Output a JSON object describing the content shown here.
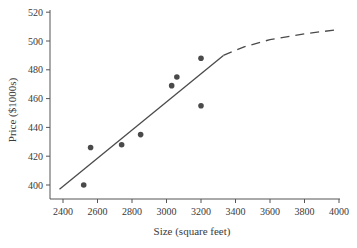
{
  "chart_data": {
    "type": "scatter",
    "title": "",
    "xlabel": "Size (square feet)",
    "ylabel": "Price ($1000s)",
    "xlim": [
      2330,
      4000
    ],
    "ylim": [
      390,
      520
    ],
    "xticks": [
      2400,
      2600,
      2800,
      3000,
      3200,
      3400,
      3600,
      3800,
      4000
    ],
    "yticks": [
      400,
      420,
      440,
      460,
      480,
      500,
      520
    ],
    "grid": false,
    "legend": null,
    "series": [
      {
        "name": "Observed sales",
        "kind": "scatter",
        "points": [
          {
            "x": 2520,
            "y": 400
          },
          {
            "x": 2560,
            "y": 426
          },
          {
            "x": 2740,
            "y": 428
          },
          {
            "x": 2850,
            "y": 435
          },
          {
            "x": 3030,
            "y": 469
          },
          {
            "x": 3060,
            "y": 475
          },
          {
            "x": 3200,
            "y": 488
          },
          {
            "x": 3200,
            "y": 455
          }
        ]
      },
      {
        "name": "Linear fit",
        "kind": "line",
        "style": "solid",
        "points": [
          {
            "x": 2380,
            "y": 397
          },
          {
            "x": 3330,
            "y": 490
          }
        ]
      },
      {
        "name": "Extrapolated curve",
        "kind": "line",
        "style": "dashed",
        "points": [
          {
            "x": 3330,
            "y": 490
          },
          {
            "x": 3450,
            "y": 496
          },
          {
            "x": 3600,
            "y": 501
          },
          {
            "x": 3800,
            "y": 505
          },
          {
            "x": 4000,
            "y": 508
          }
        ]
      }
    ]
  },
  "colors": {
    "axis": "#555555",
    "points": "#4a4a4a",
    "line": "#4a4a4a",
    "text": "#3a3a3a"
  }
}
